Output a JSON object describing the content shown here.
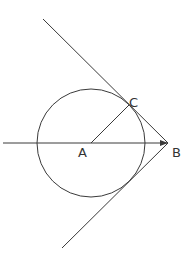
{
  "diagram": {
    "colors": {
      "line": "#3a3a3a",
      "label": "#333333",
      "background": "#ffffff"
    },
    "circle": {
      "center_label": "A",
      "cx": 91,
      "cy": 143,
      "r": 54
    },
    "points": {
      "A": {
        "label": "A",
        "x": 91,
        "y": 143
      },
      "B": {
        "label": "B",
        "x": 168,
        "y": 143
      },
      "C": {
        "label": "C",
        "x": 129,
        "y": 105
      }
    },
    "segments": [
      {
        "name": "axis-line",
        "description": "horizontal line through A ending with arrow at B"
      },
      {
        "name": "radius-AC",
        "description": "radius from A to tangent point C"
      },
      {
        "name": "upper-tangent",
        "description": "tangent line through C and B"
      },
      {
        "name": "lower-tangent",
        "description": "tangent line through B touching lower circle"
      }
    ]
  }
}
